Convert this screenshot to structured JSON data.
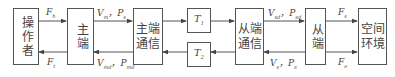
{
  "blocks": {
    "operator": "操作者",
    "master": "主端",
    "master_comm": "主端通信",
    "t1": "T",
    "t1_sub": "1",
    "t2": "T",
    "t2_sub": "2",
    "slave_comm": "从端通信",
    "slave": "从端",
    "environment": "空间环境"
  },
  "signals": {
    "fh": {
      "main": "F",
      "sub": "h"
    },
    "ft": {
      "main": "F",
      "sub": "t"
    },
    "vm": {
      "main": "V",
      "sub": "m"
    },
    "ps": {
      "main": "P",
      "sub": "s"
    },
    "vmd": {
      "main": "V",
      "sub": "md"
    },
    "pmd": {
      "main": "P",
      "sub": "md"
    },
    "vsd": {
      "main": "V",
      "sub": "sd"
    },
    "psd": {
      "main": "P",
      "sub": "sd"
    },
    "vs": {
      "main": "V",
      "sub": "s"
    },
    "ps2": {
      "main": "P",
      "sub": "s"
    },
    "fs": {
      "main": "F",
      "sub": "s"
    },
    "fe": {
      "main": "F",
      "sub": "e"
    },
    "sep": "，"
  }
}
